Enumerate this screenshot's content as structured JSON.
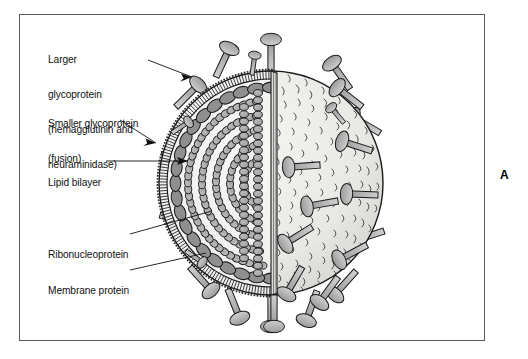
{
  "figure": {
    "panel_letter": "A",
    "background_color": "#ffffff",
    "frame_color": "#5a5a5a"
  },
  "labels": [
    {
      "id": "larger-glycoprotein",
      "lines": [
        "Larger",
        "glycoprotein",
        "(hemagglutinin and",
        "neuraminidase)"
      ],
      "text": "Larger glycoprotein (hemagglutinin and neuraminidase)",
      "x": 47,
      "y": 30,
      "leader": "arrow",
      "points_to": "large surface spike, upper left"
    },
    {
      "id": "smaller-glycoprotein",
      "lines": [
        "Smaller glycoprotein",
        "(fusion)"
      ],
      "text": "Smaller glycoprotein (fusion)",
      "x": 47,
      "y": 94,
      "leader": "arrow",
      "points_to": "small surface spike, left"
    },
    {
      "id": "lipid-bilayer",
      "lines": [
        "Lipid bilayer"
      ],
      "text": "Lipid bilayer",
      "x": 47,
      "y": 153,
      "leader": "arrow",
      "points_to": "envelope double line"
    },
    {
      "id": "ribonucleoprotein",
      "lines": [
        "Ribonucleoprotein"
      ],
      "text": "Ribonucleoprotein",
      "x": 47,
      "y": 225,
      "leader": "line",
      "points_to": "coiled bead helix in core"
    },
    {
      "id": "membrane-protein",
      "lines": [
        "Membrane protein"
      ],
      "text": "Membrane protein",
      "x": 47,
      "y": 261,
      "leader": "line",
      "points_to": "inner oval protein layer"
    }
  ],
  "structure": {
    "virion_center_x": 270,
    "virion_center_y": 182,
    "virion_radius": 112,
    "cut_plane_x": 272,
    "left_half": "cut-away cross-section showing envelope, membrane protein layer and coiled ribonucleoprotein",
    "right_half": "intact textured outer surface with projecting glycoprotein spikes"
  },
  "colors": {
    "outline": "#1a1a1a",
    "core_fill": "#f2f2f0",
    "bead_fill": "#ababab",
    "membrane_oval_fill": "#8f8f8f",
    "spike_fill": "#b4b4b4",
    "surface_fill": "#ebebe8",
    "cut_edge_fill": "#d8d8d6",
    "text": "#111111"
  }
}
